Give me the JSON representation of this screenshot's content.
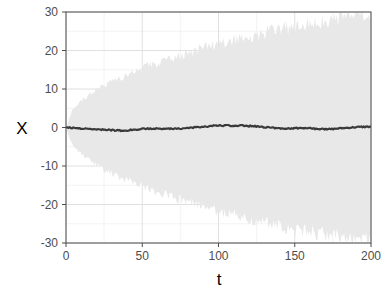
{
  "chart_data": {
    "type": "area",
    "title": "",
    "subtitle": "",
    "xlabel": "t",
    "ylabel": "X",
    "xlim": [
      0,
      200
    ],
    "ylim": [
      -30,
      30
    ],
    "grid": true,
    "legend": null,
    "legend_position": "none",
    "background": "#ffffff",
    "panel_background": "#ffffff",
    "panel_border_color": "#4d4d4d",
    "grid_color": "#ebebeb",
    "band_color": "#e8e8e8",
    "mean_line_color": "#3a3a3a",
    "mean_line_width": 2.2,
    "xticks": [
      0,
      50,
      100,
      150,
      200
    ],
    "xtick_labels": [
      "0",
      "50",
      "100",
      "150",
      "200"
    ],
    "yticks": [
      -30,
      -20,
      -10,
      0,
      10,
      20,
      30
    ],
    "ytick_labels": [
      "-30",
      "-20",
      "-10",
      "0",
      "10",
      "20",
      "30"
    ],
    "x_minor_ticks": [
      25,
      75,
      125,
      175
    ],
    "y_minor_ticks": [
      -25,
      -15,
      -5,
      5,
      15,
      25
    ],
    "series": [
      {
        "name": "envelope_upper",
        "role": "band-upper",
        "x": [
          0,
          4,
          8,
          12,
          16,
          20,
          25,
          30,
          35,
          40,
          45,
          50,
          55,
          60,
          65,
          70,
          75,
          80,
          85,
          90,
          95,
          100,
          105,
          110,
          115,
          120,
          125,
          130,
          135,
          140,
          145,
          150,
          155,
          160,
          165,
          170,
          175,
          180,
          185,
          190,
          195,
          200
        ],
        "values": [
          0.0,
          4.4,
          6.3,
          7.6,
          8.8,
          9.8,
          11.0,
          12.0,
          12.9,
          13.8,
          14.7,
          15.5,
          16.2,
          16.9,
          17.6,
          18.3,
          18.9,
          19.5,
          20.1,
          20.7,
          21.3,
          21.8,
          22.3,
          22.8,
          23.3,
          23.8,
          24.3,
          24.7,
          25.2,
          25.6,
          26.0,
          26.4,
          26.8,
          27.2,
          27.6,
          28.0,
          28.3,
          28.7,
          29.0,
          29.4,
          29.7,
          30.0
        ]
      },
      {
        "name": "envelope_lower",
        "role": "band-lower",
        "x": [
          0,
          4,
          8,
          12,
          16,
          20,
          25,
          30,
          35,
          40,
          45,
          50,
          55,
          60,
          65,
          70,
          75,
          80,
          85,
          90,
          95,
          100,
          105,
          110,
          115,
          120,
          125,
          130,
          135,
          140,
          145,
          150,
          155,
          160,
          165,
          170,
          175,
          180,
          185,
          190,
          195,
          200
        ],
        "values": [
          0.0,
          -4.4,
          -6.3,
          -7.6,
          -8.8,
          -9.8,
          -11.0,
          -12.0,
          -12.9,
          -13.8,
          -14.7,
          -15.5,
          -16.2,
          -16.9,
          -17.6,
          -18.3,
          -18.9,
          -19.5,
          -20.1,
          -20.7,
          -21.3,
          -21.8,
          -22.3,
          -22.8,
          -23.3,
          -23.8,
          -24.3,
          -24.7,
          -25.2,
          -25.6,
          -26.0,
          -26.4,
          -26.8,
          -27.2,
          -27.6,
          -28.0,
          -28.3,
          -28.7,
          -29.0,
          -29.4,
          -29.7,
          -30.0
        ]
      },
      {
        "name": "ensemble_mean",
        "role": "line",
        "x": [
          0,
          5,
          10,
          15,
          20,
          25,
          30,
          35,
          40,
          45,
          50,
          55,
          60,
          65,
          70,
          75,
          80,
          85,
          90,
          95,
          100,
          105,
          110,
          115,
          120,
          125,
          130,
          135,
          140,
          145,
          150,
          155,
          160,
          165,
          170,
          175,
          180,
          185,
          190,
          195,
          200
        ],
        "values": [
          0.0,
          -0.12,
          -0.28,
          -0.35,
          -0.42,
          -0.55,
          -0.68,
          -0.78,
          -0.72,
          -0.55,
          -0.4,
          -0.32,
          -0.25,
          -0.3,
          -0.38,
          -0.3,
          -0.15,
          0.05,
          0.18,
          0.38,
          0.55,
          0.5,
          0.42,
          0.48,
          0.4,
          0.3,
          0.12,
          -0.05,
          -0.18,
          -0.25,
          -0.2,
          -0.12,
          -0.22,
          -0.35,
          -0.48,
          -0.38,
          -0.2,
          -0.05,
          0.08,
          0.18,
          0.22
        ]
      }
    ]
  },
  "axes": {
    "x_title": "t",
    "y_title": "X"
  }
}
